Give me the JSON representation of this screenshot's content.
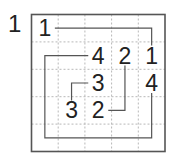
{
  "puzzle": {
    "number": "1",
    "rows": 5,
    "cols": 5,
    "colors": {
      "border": "#555555",
      "grid": "#b8b8b8",
      "path": "#555555",
      "digit": "#222222"
    },
    "clues": [
      {
        "row": 0,
        "col": 0,
        "value": "1"
      },
      {
        "row": 1,
        "col": 2,
        "value": "4"
      },
      {
        "row": 1,
        "col": 3,
        "value": "2"
      },
      {
        "row": 1,
        "col": 4,
        "value": "1"
      },
      {
        "row": 2,
        "col": 2,
        "value": "3"
      },
      {
        "row": 2,
        "col": 4,
        "value": "4"
      },
      {
        "row": 3,
        "col": 1,
        "value": "3"
      },
      {
        "row": 3,
        "col": 2,
        "value": "2"
      }
    ],
    "paths": [
      {
        "name": "path-1-to-1",
        "cells": [
          [
            0,
            0
          ],
          [
            0,
            4
          ],
          [
            1,
            4
          ]
        ]
      },
      {
        "name": "path-4-to-4",
        "cells": [
          [
            1,
            2
          ],
          [
            1,
            0
          ],
          [
            4,
            0
          ],
          [
            4,
            4
          ],
          [
            2,
            4
          ]
        ]
      },
      {
        "name": "path-3-to-3",
        "cells": [
          [
            2,
            2
          ],
          [
            2,
            1
          ],
          [
            3,
            1
          ]
        ]
      },
      {
        "name": "path-2-to-2",
        "cells": [
          [
            1,
            3
          ],
          [
            3,
            3
          ],
          [
            3,
            2
          ]
        ]
      }
    ]
  }
}
